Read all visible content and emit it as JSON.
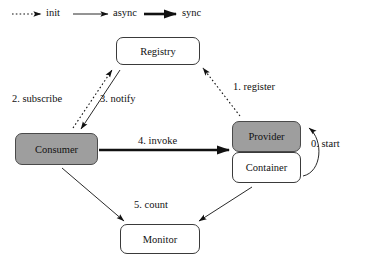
{
  "diagram": {
    "legend": {
      "items": [
        {
          "id": "init",
          "label": "init",
          "style": "dotted",
          "color": "#111111"
        },
        {
          "id": "async",
          "label": "async",
          "style": "thin-solid",
          "color": "#111111"
        },
        {
          "id": "sync",
          "label": "sync",
          "style": "thick-solid",
          "color": "#111111"
        }
      ]
    },
    "nodes": [
      {
        "id": "registry",
        "label": "Registry",
        "fill": "#ffffff",
        "x": 116,
        "y": 37,
        "w": 84,
        "h": 28
      },
      {
        "id": "consumer",
        "label": "Consumer",
        "fill": "#9e9e9e",
        "x": 15,
        "y": 133,
        "w": 83,
        "h": 32
      },
      {
        "id": "provider",
        "label": "Provider",
        "fill": "#9e9e9e",
        "x": 232,
        "y": 121,
        "w": 69,
        "h": 31
      },
      {
        "id": "container",
        "label": "Container",
        "fill": "#ffffff",
        "x": 232,
        "y": 152,
        "w": 69,
        "h": 31
      },
      {
        "id": "monitor",
        "label": "Monitor",
        "fill": "#ffffff",
        "x": 120,
        "y": 224,
        "w": 80,
        "h": 30
      }
    ],
    "edges": [
      {
        "id": "register",
        "label": "0. start",
        "order": "0",
        "name": "start",
        "from": "container",
        "to": "provider",
        "style": "thin-solid",
        "shape": "self-loop"
      },
      {
        "id": "register1",
        "label": "1. register",
        "order": "1",
        "name": "register",
        "from": "provider",
        "to": "registry",
        "style": "dotted",
        "shape": "diagonal"
      },
      {
        "id": "subscribe",
        "label": "2. subscribe",
        "order": "2",
        "name": "subscribe",
        "from": "consumer",
        "to": "registry",
        "style": "dotted",
        "shape": "diagonal"
      },
      {
        "id": "notify",
        "label": "3. notify",
        "order": "3",
        "name": "notify",
        "from": "registry",
        "to": "consumer",
        "style": "thin-solid",
        "shape": "diagonal"
      },
      {
        "id": "invoke",
        "label": "4. invoke",
        "order": "4",
        "name": "invoke",
        "from": "consumer",
        "to": "provider",
        "style": "thick-solid",
        "shape": "horizontal"
      },
      {
        "id": "count1",
        "label": "5. count",
        "order": "5",
        "name": "count",
        "from": "consumer",
        "to": "monitor",
        "style": "thin-solid",
        "shape": "diagonal"
      },
      {
        "id": "count2",
        "label": "",
        "order": "5",
        "name": "count",
        "from": "container",
        "to": "monitor",
        "style": "thin-solid",
        "shape": "diagonal"
      }
    ],
    "labels": {
      "start": "0. start",
      "register": "1. register",
      "subscribe": "2. subscribe",
      "notify": "3. notify",
      "invoke": "4. invoke",
      "count": "5. count"
    },
    "colors": {
      "stroke": "#111111",
      "node_border": "#3a3a3a",
      "node_fill_gray": "#9e9e9e",
      "node_fill_white": "#ffffff",
      "background": "#ffffff"
    }
  }
}
